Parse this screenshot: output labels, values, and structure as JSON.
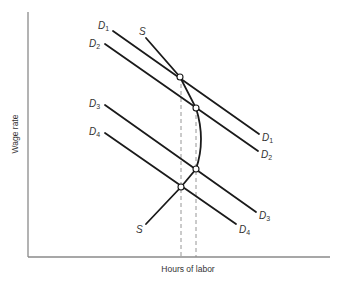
{
  "axes": {
    "x_label": "Hours of labor",
    "y_label": "Wage rate"
  },
  "curves": {
    "supply": {
      "label": "S",
      "label_bottom": "S"
    },
    "demand": [
      {
        "label": "D",
        "sub": "1"
      },
      {
        "label": "D",
        "sub": "2"
      },
      {
        "label": "D",
        "sub": "3"
      },
      {
        "label": "D",
        "sub": "4"
      }
    ]
  },
  "equilibria": [
    {
      "name": "S-D1",
      "x": 180,
      "y": 77
    },
    {
      "name": "S-D2",
      "x": 196,
      "y": 108
    },
    {
      "name": "S-D3",
      "x": 196,
      "y": 169
    },
    {
      "name": "S-D4",
      "x": 181,
      "y": 187
    }
  ],
  "colors": {
    "curve": "#1a1a1a",
    "axis": "#8a8a8a",
    "background": "#ffffff"
  }
}
